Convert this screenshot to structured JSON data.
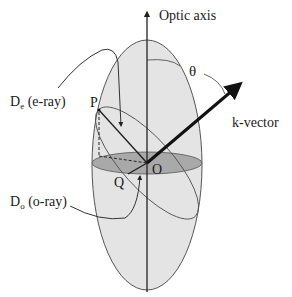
{
  "diagram": {
    "labels": {
      "optic_axis": "Optic axis",
      "theta": "θ",
      "k_vector": "k-vector",
      "de_main": "D",
      "de_sub": "e",
      "de_rest": " (e-ray)",
      "do_main": "D",
      "do_sub": "o",
      "do_rest": " (o-ray)",
      "point_p": "P",
      "point_o": "O",
      "point_q": "Q"
    },
    "colors": {
      "ellipsoid_fill": "#e4e4e4",
      "equatorial_disk": "#a9a9a9",
      "line": "#222222",
      "outline": "#555555"
    }
  }
}
